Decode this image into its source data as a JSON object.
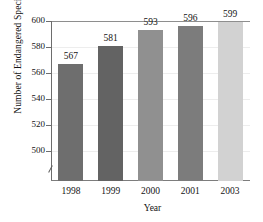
{
  "chart_data": {
    "type": "bar",
    "title": "",
    "subtitle": "",
    "xlabel": "Year",
    "ylabel": "Number of Endangered Species",
    "categories": [
      "1998",
      "1999",
      "2000",
      "2001",
      "2003"
    ],
    "values": [
      567,
      581,
      593,
      596,
      599
    ],
    "value_labels": [
      "567",
      "581",
      "593",
      "596",
      "599"
    ],
    "ylim": [
      490,
      600
    ],
    "yticks": [
      500,
      520,
      540,
      560,
      580,
      600
    ],
    "ytick_labels": [
      "500",
      "520",
      "540",
      "560",
      "580",
      "600"
    ],
    "y_axis_break": true,
    "grid": true,
    "grid_axis": "y",
    "legend": "none",
    "bar_colors": [
      "#6e6e6e",
      "#636363",
      "#909090",
      "#7c7c7c",
      "#d2d2d2"
    ],
    "series": [
      {
        "name": "Number of Endangered Species",
        "values": [
          567,
          581,
          593,
          596,
          599
        ]
      }
    ],
    "points": [
      {
        "category": "1998",
        "value": 567,
        "color": "#6e6e6e"
      },
      {
        "category": "1999",
        "value": 581,
        "color": "#636363"
      },
      {
        "category": "2000",
        "value": 593,
        "color": "#909090"
      },
      {
        "category": "2001",
        "value": 596,
        "color": "#7c7c7c"
      },
      {
        "category": "2003",
        "value": 599,
        "color": "#d2d2d2"
      }
    ]
  },
  "axes": {
    "y_title": "Number of Endangered Species",
    "x_title": "Year"
  },
  "colors": {
    "background": "#ffffff",
    "axis": "#6d6d6d",
    "grid": "#ededed",
    "text": "#131313"
  }
}
